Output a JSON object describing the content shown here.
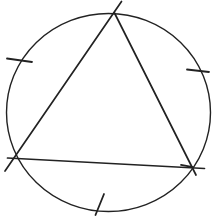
{
  "canvas": {
    "width": 218,
    "height": 220,
    "background_color": "#ffffff"
  },
  "figure": {
    "kind": "geometry-diagram",
    "stroke_color": "#222222",
    "circle": {
      "cx": 108.5,
      "cy": 112.5,
      "rx": 102,
      "ry": 99,
      "stroke_width": 1.4
    },
    "triangle": {
      "stroke_width": 1.7,
      "vertices": [
        {
          "name": "vertex-top",
          "x": 114.5,
          "y": 13
        },
        {
          "name": "vertex-bottom-left",
          "x": 13.5,
          "y": 158.5
        },
        {
          "name": "vertex-bottom-right",
          "x": 192,
          "y": 167
        }
      ],
      "edges": [
        {
          "name": "triangle-edge-left",
          "x1": 121.5,
          "y1": 1.5,
          "x2": 5,
          "y2": 171
        },
        {
          "name": "triangle-edge-right",
          "x1": 114.5,
          "y1": 13,
          "x2": 196,
          "y2": 175
        },
        {
          "name": "triangle-edge-bottom",
          "x1": 7.5,
          "y1": 158,
          "x2": 204.5,
          "y2": 168.5
        }
      ],
      "overstrokes": [
        {
          "name": "edge-bottom-end-overstroke",
          "x1": 181,
          "y1": 164.8,
          "x2": 193,
          "y2": 167.2
        }
      ]
    },
    "arc_ticks": {
      "stroke_width": 1.8,
      "items": [
        {
          "name": "tick-upper-left-arc",
          "x1": 7,
          "y1": 58.5,
          "x2": 32,
          "y2": 62
        },
        {
          "name": "tick-upper-right-arc",
          "x1": 187,
          "y1": 69.5,
          "x2": 209,
          "y2": 72
        },
        {
          "name": "tick-bottom-arc",
          "x1": 104,
          "y1": 194,
          "x2": 95.5,
          "y2": 215
        }
      ]
    }
  }
}
